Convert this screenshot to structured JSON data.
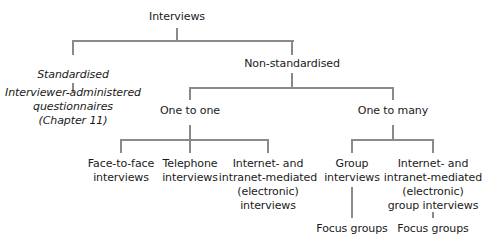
{
  "diagram": {
    "type": "tree",
    "line_color": "#8a8a8a",
    "text_color": "#1a1a1a",
    "root": {
      "label": "Interviews"
    },
    "standardised": {
      "label": "Standardised",
      "child": {
        "lines": [
          "Interviewer-administered",
          "questionnaires",
          "(Chapter 11)"
        ]
      }
    },
    "non_standardised": {
      "label": "Non-standardised",
      "one_to_one": {
        "label": "One to one",
        "children": [
          {
            "lines": [
              "Face-to-face",
              "interviews"
            ]
          },
          {
            "lines": [
              "Telephone",
              "interviews"
            ]
          },
          {
            "lines": [
              "Internet- and",
              "intranet-mediated",
              "(electronic)",
              "interviews"
            ]
          }
        ]
      },
      "one_to_many": {
        "label": "One to many",
        "children": [
          {
            "lines": [
              "Group",
              "interviews"
            ],
            "child": {
              "label": "Focus groups"
            }
          },
          {
            "lines": [
              "Internet- and",
              "intranet-mediated",
              "(electronic)",
              "group interviews"
            ],
            "child": {
              "label": "Focus groups"
            }
          }
        ]
      }
    }
  }
}
